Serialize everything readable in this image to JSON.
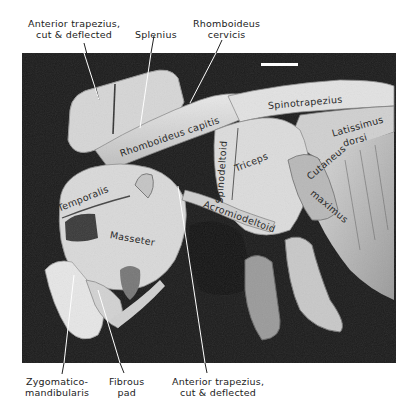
{
  "figure": {
    "scale_bar": true
  },
  "outer_labels": {
    "anterior_trapezius_top": [
      "Anterior trapezius,",
      "cut & deflected"
    ],
    "splenius": [
      "Splenius"
    ],
    "rhomboideus_cervicis": [
      "Rhomboideus",
      "cervicis"
    ],
    "zygomaticomandibularis": [
      "Zygomatico-",
      "mandibularis"
    ],
    "fibrous_pad": [
      "Fibrous",
      "pad"
    ],
    "anterior_trapezius_bottom": [
      "Anterior trapezius,",
      "cut & deflected"
    ]
  },
  "inner_labels": {
    "spinotrapezius": "Spinotrapezius",
    "latissimus_1": "Latissimus",
    "latissimus_2": "dorsi",
    "rhomboideus_capitis": "Rhomboideus capitis",
    "spinodeltoid": "Spinodeltoid",
    "triceps": "Triceps",
    "cutaneous_1": "Cutaneus",
    "cutaneous_2": "maximus",
    "temporalis": "Temporalis",
    "acromiodeltoid": "Acromiodeltoid",
    "masseter": "Masseter"
  }
}
